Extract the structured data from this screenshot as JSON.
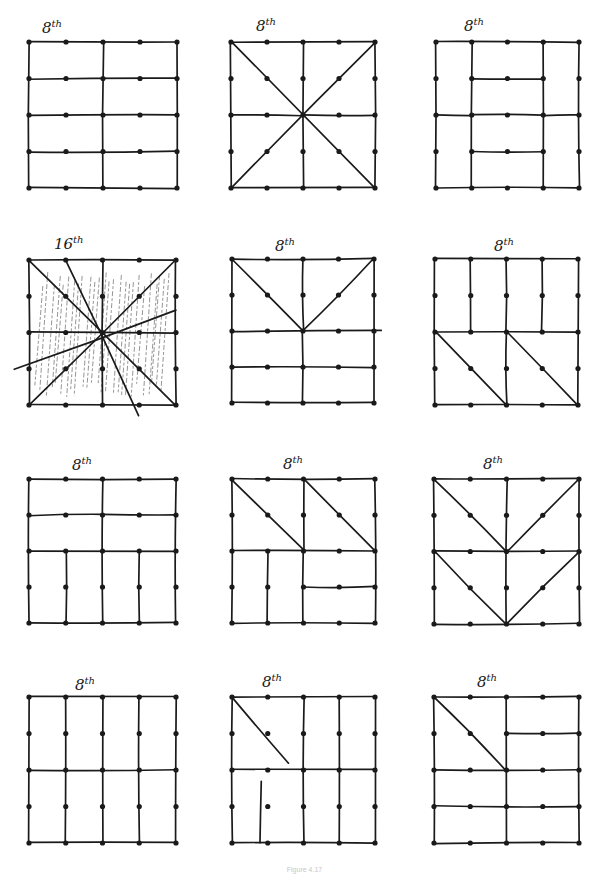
{
  "page": {
    "caption": "Figure 4.17",
    "background": "#ffffff",
    "ink_color": "#1a1a1a"
  },
  "grid": {
    "dots_per_side": 5,
    "units_per_side": 4
  },
  "panels": [
    {
      "label": "8th",
      "row": 0,
      "col": 0,
      "x": 29,
      "y": 42,
      "w": 148,
      "h": 146,
      "label_x": 42,
      "label_y": 18,
      "lines": [
        [
          0,
          0,
          4,
          0
        ],
        [
          0,
          0,
          0,
          4
        ],
        [
          4,
          0,
          4,
          4
        ],
        [
          0,
          4,
          4,
          4
        ],
        [
          2,
          0,
          2,
          4
        ],
        [
          0,
          1,
          4,
          1
        ],
        [
          0,
          2,
          4,
          2
        ],
        [
          0,
          3,
          4,
          3
        ]
      ],
      "hatched": false
    },
    {
      "label": "8th",
      "row": 0,
      "col": 1,
      "x": 231,
      "y": 42,
      "w": 144,
      "h": 146,
      "label_x": 256,
      "label_y": 16,
      "lines": [
        [
          0,
          0,
          4,
          0
        ],
        [
          0,
          0,
          0,
          4
        ],
        [
          4,
          0,
          4,
          4
        ],
        [
          0,
          4,
          4,
          4
        ],
        [
          2,
          0,
          2,
          4
        ],
        [
          0,
          0,
          4,
          4
        ],
        [
          4,
          0,
          0,
          4
        ],
        [
          0,
          2,
          2,
          2
        ],
        [
          2,
          2,
          4,
          2
        ]
      ],
      "hatched": false
    },
    {
      "label": "8th",
      "row": 0,
      "col": 2,
      "x": 436,
      "y": 42,
      "w": 143,
      "h": 146,
      "label_x": 464,
      "label_y": 16,
      "lines": [
        [
          0,
          0,
          4,
          0
        ],
        [
          0,
          0,
          0,
          4
        ],
        [
          4,
          0,
          4,
          4
        ],
        [
          0,
          4,
          4,
          4
        ],
        [
          1,
          0,
          1,
          4
        ],
        [
          3,
          0,
          3,
          4
        ],
        [
          1,
          1,
          3,
          1
        ],
        [
          0,
          2,
          1,
          2
        ],
        [
          1,
          2,
          3,
          2
        ],
        [
          3,
          2,
          4,
          2
        ],
        [
          1,
          3,
          3,
          3
        ]
      ],
      "hatched": false
    },
    {
      "label": "16th",
      "row": 1,
      "col": 0,
      "x": 29,
      "y": 260,
      "w": 147,
      "h": 145,
      "label_x": 54,
      "label_y": 234,
      "lines": [
        [
          0,
          0,
          4,
          0
        ],
        [
          0,
          0,
          0,
          4
        ],
        [
          4,
          0,
          4,
          4
        ],
        [
          0,
          4,
          4,
          4
        ],
        [
          0,
          0,
          4,
          4
        ],
        [
          4,
          0,
          0,
          4
        ],
        [
          2,
          0,
          2,
          4
        ],
        [
          0,
          2,
          4,
          2
        ],
        [
          -0.4,
          3,
          4,
          1.4
        ],
        [
          1,
          0,
          3,
          4.3
        ]
      ],
      "hatched": true
    },
    {
      "label": "8th",
      "row": 1,
      "col": 1,
      "x": 232,
      "y": 259,
      "w": 142,
      "h": 144,
      "label_x": 275,
      "label_y": 236,
      "lines": [
        [
          0,
          0,
          4,
          0
        ],
        [
          0,
          0,
          0,
          4
        ],
        [
          4,
          0,
          4,
          4
        ],
        [
          0,
          4,
          4,
          4
        ],
        [
          2,
          0,
          2,
          2
        ],
        [
          0,
          0,
          2,
          2
        ],
        [
          4,
          0,
          2,
          2
        ],
        [
          0,
          2,
          4.2,
          2
        ],
        [
          2,
          2,
          2,
          4
        ],
        [
          0,
          3,
          4,
          3
        ]
      ],
      "hatched": false
    },
    {
      "label": "8th",
      "row": 1,
      "col": 2,
      "x": 435,
      "y": 259,
      "w": 143,
      "h": 146,
      "label_x": 494,
      "label_y": 236,
      "lines": [
        [
          0,
          0,
          4,
          0
        ],
        [
          0,
          0,
          0,
          4
        ],
        [
          4,
          0,
          4,
          4
        ],
        [
          0,
          4,
          4,
          4
        ],
        [
          1,
          0,
          1,
          2
        ],
        [
          2,
          0,
          2,
          2
        ],
        [
          3,
          0,
          3,
          2
        ],
        [
          0,
          2,
          4,
          2
        ],
        [
          2,
          2,
          2,
          4
        ],
        [
          0,
          2,
          2,
          4
        ],
        [
          2,
          2,
          4,
          4
        ]
      ],
      "hatched": false
    },
    {
      "label": "8th",
      "row": 2,
      "col": 0,
      "x": 29,
      "y": 479,
      "w": 147,
      "h": 144,
      "label_x": 72,
      "label_y": 455,
      "lines": [
        [
          0,
          0,
          4,
          0
        ],
        [
          0,
          0,
          0,
          4
        ],
        [
          4,
          0,
          4,
          4
        ],
        [
          0,
          4,
          4,
          4
        ],
        [
          2,
          0,
          2,
          4
        ],
        [
          0,
          1,
          2,
          1
        ],
        [
          2,
          1,
          4,
          1
        ],
        [
          0,
          2,
          4,
          2
        ],
        [
          1,
          2,
          1,
          4
        ],
        [
          3,
          2,
          3,
          4
        ]
      ],
      "hatched": false
    },
    {
      "label": "8th",
      "row": 2,
      "col": 1,
      "x": 232,
      "y": 479,
      "w": 143,
      "h": 144,
      "label_x": 283,
      "label_y": 454,
      "lines": [
        [
          0,
          0,
          4,
          0
        ],
        [
          0,
          0,
          0,
          4
        ],
        [
          4,
          0,
          4,
          4
        ],
        [
          0,
          4,
          4,
          4
        ],
        [
          2,
          0,
          2,
          2
        ],
        [
          0,
          0,
          2,
          2
        ],
        [
          2,
          0,
          4,
          2
        ],
        [
          0,
          2,
          4,
          2
        ],
        [
          1,
          2,
          1,
          4
        ],
        [
          2,
          2,
          2,
          4
        ],
        [
          2,
          3,
          4,
          3
        ]
      ],
      "hatched": false
    },
    {
      "label": "8th",
      "row": 2,
      "col": 2,
      "x": 434,
      "y": 479,
      "w": 145,
      "h": 145,
      "label_x": 483,
      "label_y": 454,
      "lines": [
        [
          0,
          0,
          4,
          0
        ],
        [
          0,
          0,
          0,
          4
        ],
        [
          4,
          0,
          4,
          4
        ],
        [
          0,
          4,
          4,
          4
        ],
        [
          2,
          0,
          2,
          4
        ],
        [
          0,
          0,
          2,
          2
        ],
        [
          4,
          0,
          2,
          2
        ],
        [
          0,
          2,
          4,
          2
        ],
        [
          0,
          2,
          2,
          4
        ],
        [
          4,
          2,
          2,
          4
        ]
      ],
      "hatched": false
    },
    {
      "label": "8th",
      "row": 3,
      "col": 0,
      "x": 29,
      "y": 697,
      "w": 147,
      "h": 146,
      "label_x": 75,
      "label_y": 675,
      "lines": [
        [
          0,
          0,
          4,
          0
        ],
        [
          0,
          0,
          0,
          4
        ],
        [
          4,
          0,
          4,
          4
        ],
        [
          0,
          4,
          4,
          4
        ],
        [
          1,
          0,
          1,
          4
        ],
        [
          2,
          0,
          2,
          4
        ],
        [
          3,
          0,
          3,
          4
        ],
        [
          0,
          2,
          4,
          2
        ]
      ],
      "hatched": false
    },
    {
      "label": "8th",
      "row": 3,
      "col": 1,
      "x": 232,
      "y": 697,
      "w": 143,
      "h": 146,
      "label_x": 262,
      "label_y": 672,
      "lines": [
        [
          0,
          0,
          4,
          0
        ],
        [
          0,
          0,
          0,
          4
        ],
        [
          4,
          0,
          4,
          4
        ],
        [
          0,
          4,
          4,
          4
        ],
        [
          2,
          0,
          2,
          4
        ],
        [
          3,
          0,
          3,
          4
        ],
        [
          0,
          0,
          1.6,
          1.8
        ],
        [
          0,
          2,
          4,
          2
        ],
        [
          0.8,
          2.3,
          0.8,
          4
        ]
      ],
      "hatched": false
    },
    {
      "label": "8th",
      "row": 3,
      "col": 2,
      "x": 434,
      "y": 697,
      "w": 145,
      "h": 146,
      "label_x": 477,
      "label_y": 672,
      "lines": [
        [
          0,
          0,
          4,
          0
        ],
        [
          0,
          0,
          0,
          4
        ],
        [
          4,
          0,
          4,
          4
        ],
        [
          0,
          4,
          4,
          4
        ],
        [
          2,
          0,
          2,
          4
        ],
        [
          0,
          0,
          2,
          2
        ],
        [
          2,
          1,
          4,
          1
        ],
        [
          0,
          2,
          4,
          2
        ],
        [
          0,
          3,
          4,
          3
        ]
      ],
      "hatched": false
    }
  ]
}
